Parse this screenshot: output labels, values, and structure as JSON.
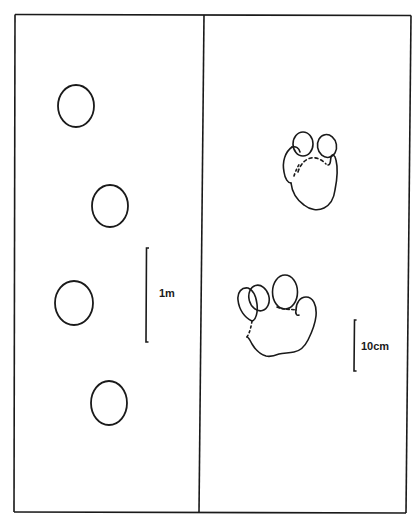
{
  "figure": {
    "panels": [
      {
        "name": "trackway",
        "description": "Track pattern (stride)",
        "footprints": [
          {
            "cx": 76,
            "cy": 106,
            "rx": 18,
            "ry": 21
          },
          {
            "cx": 110,
            "cy": 206,
            "rx": 18,
            "ry": 21
          },
          {
            "cx": 74,
            "cy": 303,
            "rx": 19,
            "ry": 22
          },
          {
            "cx": 109,
            "cy": 403,
            "rx": 18,
            "ry": 22
          }
        ],
        "scale_bar": {
          "label": "1m"
        }
      },
      {
        "name": "footprint-detail",
        "description": "Fore and hind paw prints",
        "prints": [
          "upper-paw-print",
          "lower-paw-print"
        ],
        "scale_bar": {
          "label": "10cm"
        }
      }
    ],
    "colors": {
      "ink": "#1a1a1a",
      "paper": "#ffffff"
    }
  }
}
